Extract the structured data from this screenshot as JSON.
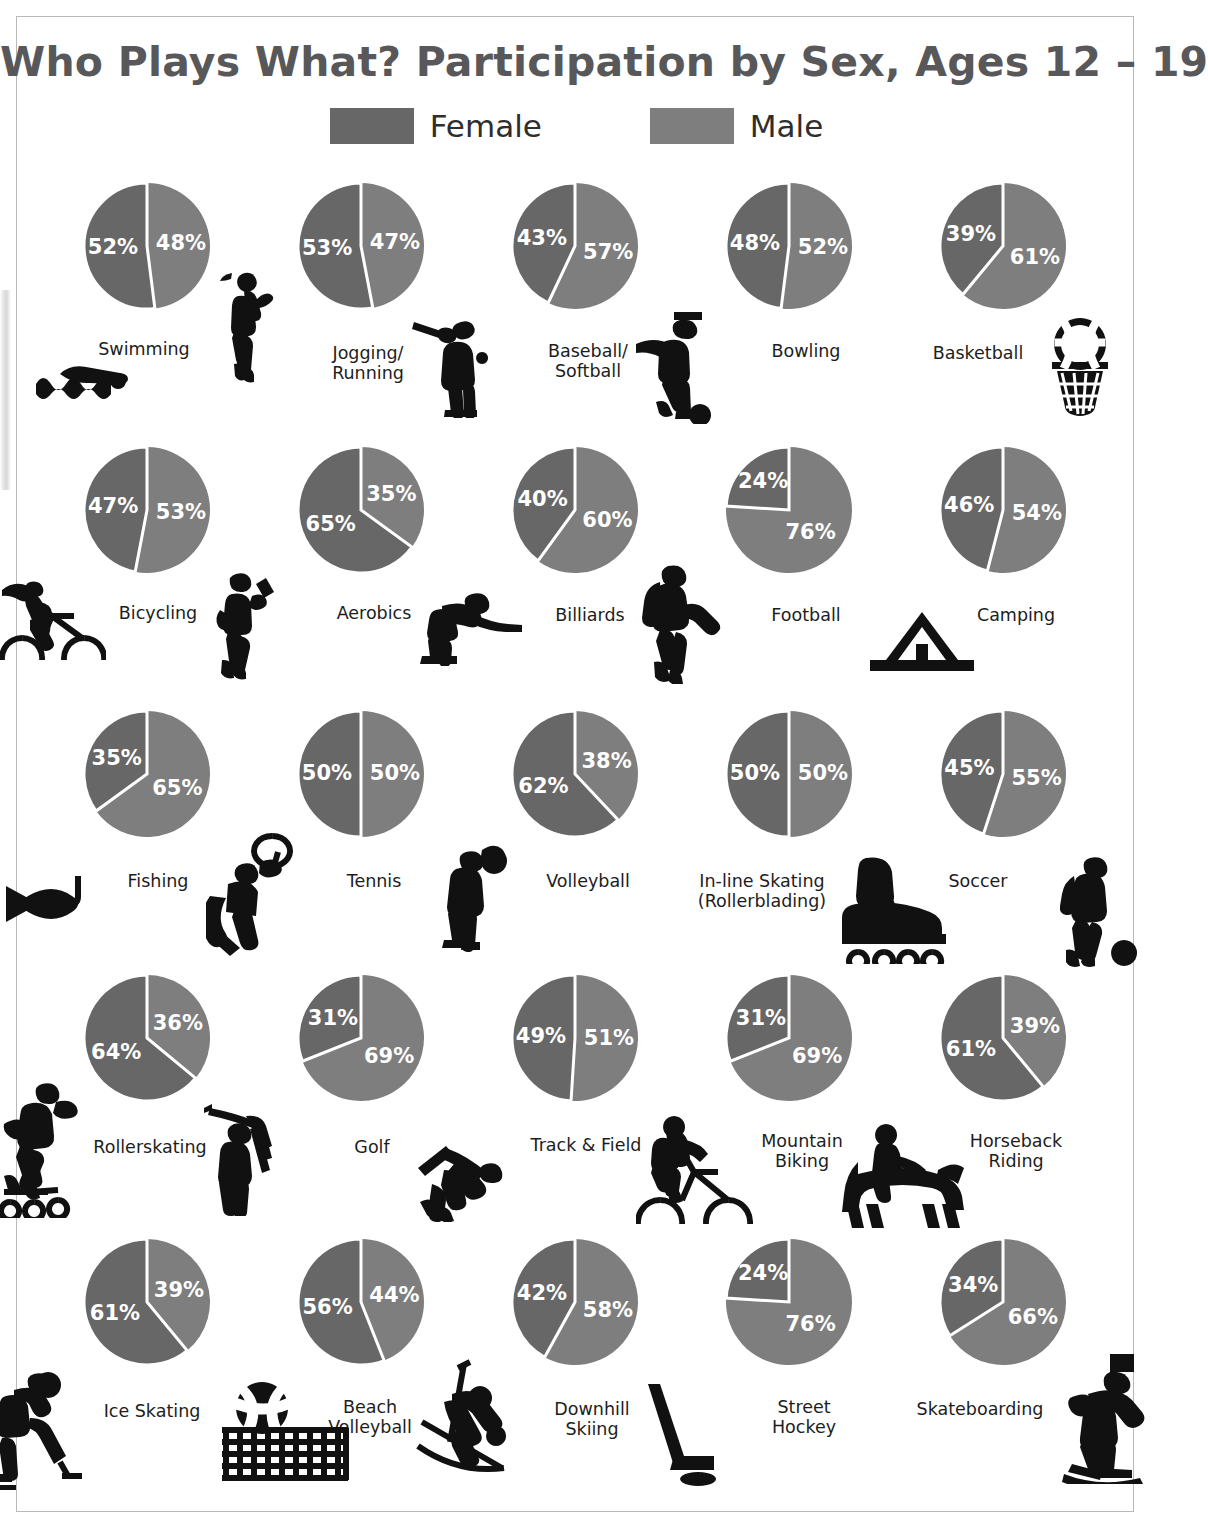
{
  "title": "Who Plays What? Participation by Sex, Ages 12 – 19",
  "legend": {
    "female": {
      "label": "Female",
      "color": "#676767"
    },
    "male": {
      "label": "Male",
      "color": "#7e7e7e"
    }
  },
  "colors": {
    "female_slice": "#676767",
    "male_slice": "#7e7e7e",
    "slice_divider": "#ffffff",
    "label_text": "#1d1d1d",
    "title_text": "#58585a",
    "icon": "#111111",
    "frame": "#b9b9b9"
  },
  "chart_data": {
    "type": "pie",
    "title": "Who Plays What? Participation by Sex, Ages 12 – 19",
    "legend_entries": [
      "Female",
      "Male"
    ],
    "legend_position": "top-center",
    "series_names": [
      "Female",
      "Male"
    ],
    "units": "percent",
    "note": "25 small multiples; each pie sums to 100%. Female (dark) slice drawn from 12 o'clock counter-clockwise; Male (light) slice drawn from 12 o'clock clockwise.",
    "charts": [
      {
        "sport": "Swimming",
        "label_lines": [
          "Swimming"
        ],
        "female": 52,
        "male": 48,
        "icon": "swimmer-icon"
      },
      {
        "sport": "Jogging/Running",
        "label_lines": [
          "Jogging/",
          "Running"
        ],
        "female": 53,
        "male": 47,
        "icon": "runner-icon"
      },
      {
        "sport": "Baseball/Softball",
        "label_lines": [
          "Baseball/",
          "Softball"
        ],
        "female": 43,
        "male": 57,
        "icon": "batter-icon"
      },
      {
        "sport": "Bowling",
        "label_lines": [
          "Bowling"
        ],
        "female": 48,
        "male": 52,
        "icon": "bowler-icon"
      },
      {
        "sport": "Basketball",
        "label_lines": [
          "Basketball"
        ],
        "female": 39,
        "male": 61,
        "icon": "basketball-hoop-icon"
      },
      {
        "sport": "Bicycling",
        "label_lines": [
          "Bicycling"
        ],
        "female": 47,
        "male": 53,
        "icon": "bicyclist-icon"
      },
      {
        "sport": "Aerobics",
        "label_lines": [
          "Aerobics"
        ],
        "female": 65,
        "male": 35,
        "icon": "aerobics-icon"
      },
      {
        "sport": "Billiards",
        "label_lines": [
          "Billiards"
        ],
        "female": 40,
        "male": 60,
        "icon": "billiards-player-icon"
      },
      {
        "sport": "Football",
        "label_lines": [
          "Football"
        ],
        "female": 24,
        "male": 76,
        "icon": "football-player-icon"
      },
      {
        "sport": "Camping",
        "label_lines": [
          "Camping"
        ],
        "female": 46,
        "male": 54,
        "icon": "tent-icon"
      },
      {
        "sport": "Fishing",
        "label_lines": [
          "Fishing"
        ],
        "female": 35,
        "male": 65,
        "icon": "fish-hook-icon"
      },
      {
        "sport": "Tennis",
        "label_lines": [
          "Tennis"
        ],
        "female": 50,
        "male": 50,
        "icon": "tennis-player-icon"
      },
      {
        "sport": "Volleyball",
        "label_lines": [
          "Volleyball"
        ],
        "female": 62,
        "male": 38,
        "icon": "volleyball-player-icon"
      },
      {
        "sport": "In-line Skating (Rollerblading)",
        "label_lines": [
          "In-line Skating",
          "(Rollerblading)"
        ],
        "female": 50,
        "male": 50,
        "icon": "inline-skate-icon"
      },
      {
        "sport": "Soccer",
        "label_lines": [
          "Soccer"
        ],
        "female": 45,
        "male": 55,
        "icon": "soccer-player-icon"
      },
      {
        "sport": "Rollerskating",
        "label_lines": [
          "Rollerskating"
        ],
        "female": 64,
        "male": 36,
        "icon": "rollerskater-icon"
      },
      {
        "sport": "Golf",
        "label_lines": [
          "Golf"
        ],
        "female": 31,
        "male": 69,
        "icon": "golfer-icon"
      },
      {
        "sport": "Track & Field",
        "label_lines": [
          "Track & Field"
        ],
        "female": 49,
        "male": 51,
        "icon": "hurdler-icon"
      },
      {
        "sport": "Mountain Biking",
        "label_lines": [
          "Mountain",
          "Biking"
        ],
        "female": 31,
        "male": 69,
        "icon": "mountain-biker-icon"
      },
      {
        "sport": "Horseback Riding",
        "label_lines": [
          "Horseback",
          "Riding"
        ],
        "female": 61,
        "male": 39,
        "icon": "horseback-rider-icon"
      },
      {
        "sport": "Ice Skating",
        "label_lines": [
          "Ice Skating"
        ],
        "female": 61,
        "male": 39,
        "icon": "ice-skater-icon"
      },
      {
        "sport": "Beach Volleyball",
        "label_lines": [
          "Beach",
          "Volleyball"
        ],
        "female": 56,
        "male": 44,
        "icon": "beach-volleyball-net-icon"
      },
      {
        "sport": "Downhill Skiing",
        "label_lines": [
          "Downhill",
          "Skiing"
        ],
        "female": 42,
        "male": 58,
        "icon": "skier-icon"
      },
      {
        "sport": "Street Hockey",
        "label_lines": [
          "Street",
          "Hockey"
        ],
        "female": 24,
        "male": 76,
        "icon": "hockey-stick-puck-icon"
      },
      {
        "sport": "Skateboarding",
        "label_lines": [
          "Skateboarding"
        ],
        "female": 34,
        "male": 66,
        "icon": "skateboarder-icon"
      }
    ]
  }
}
